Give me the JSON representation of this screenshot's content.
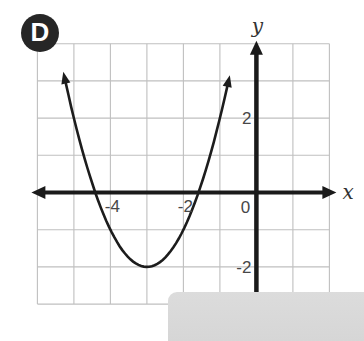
{
  "figure": {
    "badge_label": "D",
    "badge_bg": "#262626",
    "badge_fg": "#ffffff"
  },
  "overlay_card": {
    "bg": "#d9d9d9"
  },
  "colors": {
    "background": "#ffffff",
    "axis": "#1a1a1a",
    "curve": "#1c1c1c",
    "grid": "#bfbfbf",
    "tick_text": "#474747",
    "axis_label_text": "#333333"
  },
  "chart_data": {
    "type": "line",
    "title": "",
    "function": {
      "form": "vertex",
      "a": 1,
      "h": -3,
      "k": -2
    },
    "domain": [
      -5.22,
      -0.8
    ],
    "x_range": [
      -6,
      2
    ],
    "y_range": [
      -3,
      4
    ],
    "grid_step": 1,
    "grid": true,
    "vertex": [
      -3,
      -2
    ],
    "x_intercepts": [
      -4.41,
      -1.59
    ],
    "points": [
      [
        -5,
        2
      ],
      [
        -4,
        -1
      ],
      [
        -3,
        -2
      ],
      [
        -2,
        -1
      ],
      [
        -1,
        2
      ]
    ],
    "x_axis_label": "x",
    "y_axis_label": "y",
    "origin_label": "0",
    "x_tick_labels": [
      {
        "value": -4,
        "label": "-4"
      },
      {
        "value": -2,
        "label": "-2"
      }
    ],
    "y_tick_labels": [
      {
        "value": 2,
        "label": "2"
      },
      {
        "value": -2,
        "label": "-2"
      }
    ]
  }
}
